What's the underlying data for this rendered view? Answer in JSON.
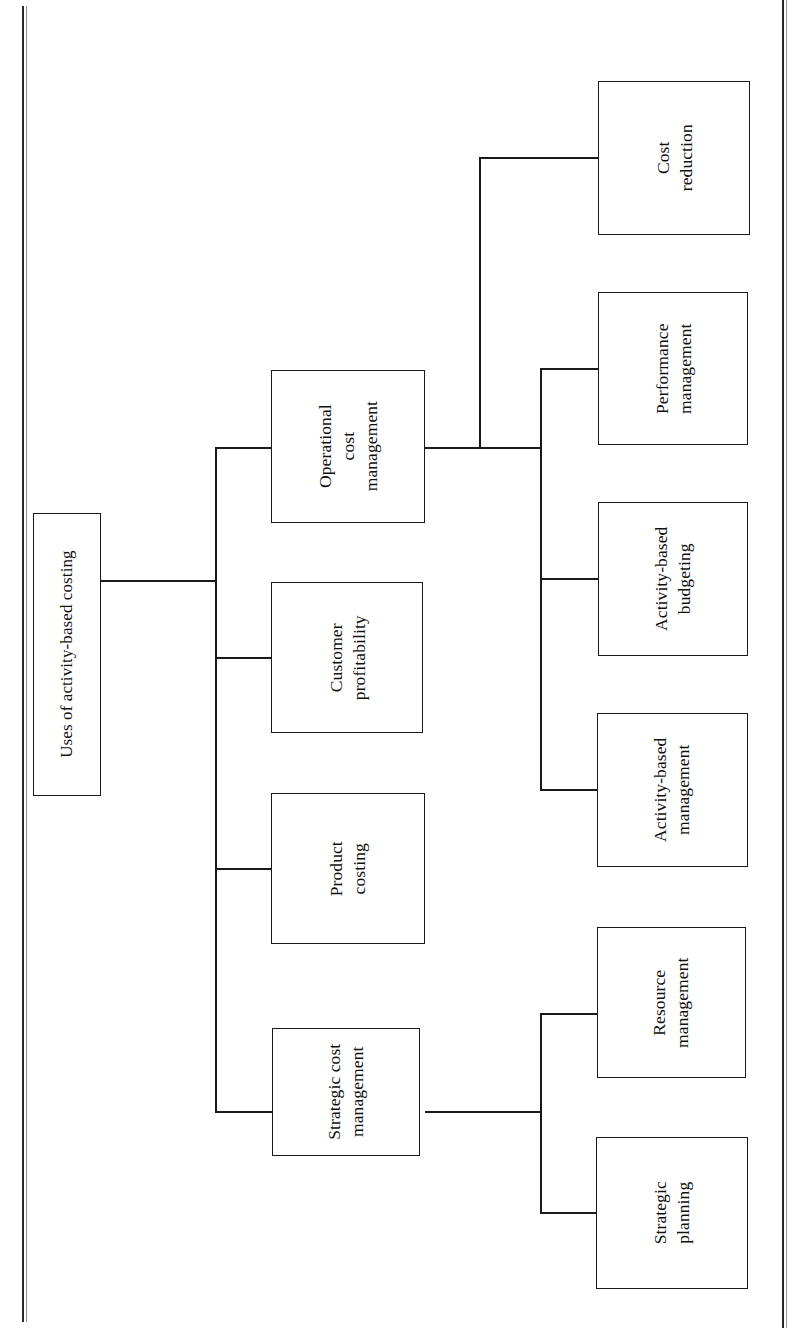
{
  "diagram": {
    "type": "hierarchy-tree",
    "orientation": "rotated-90-ccw",
    "root": {
      "label": "Uses of activity-based costing"
    },
    "level1": [
      {
        "id": "operational-cost-management",
        "label": "Operational\ncost\nmanagement"
      },
      {
        "id": "customer-profitability",
        "label": "Customer\nprofitability"
      },
      {
        "id": "product-costing",
        "label": "Product\ncosting"
      },
      {
        "id": "strategic-cost-management",
        "label": "Strategic cost\nmanagement"
      }
    ],
    "level2": [
      {
        "id": "cost-reduction",
        "parent": "operational-cost-management",
        "label": "Cost\nreduction"
      },
      {
        "id": "performance-management",
        "parent": "operational-cost-management",
        "label": "Performance\nmanagement"
      },
      {
        "id": "activity-based-budgeting",
        "parent": "operational-cost-management",
        "label": "Activity-based\nbudgeting"
      },
      {
        "id": "activity-based-management",
        "parent": "operational-cost-management",
        "label": "Activity-based\nmanagement"
      },
      {
        "id": "resource-management",
        "parent": "strategic-cost-management",
        "label": "Resource\nmanagement"
      },
      {
        "id": "strategic-planning",
        "parent": "strategic-cost-management",
        "label": "Strategic\nplanning"
      }
    ],
    "colors": {
      "background": "#ffffff",
      "box_border": "#1a1a1a",
      "connector": "#1a1a1a",
      "text": "#101010",
      "page_rule": "#2a2a2a"
    }
  }
}
